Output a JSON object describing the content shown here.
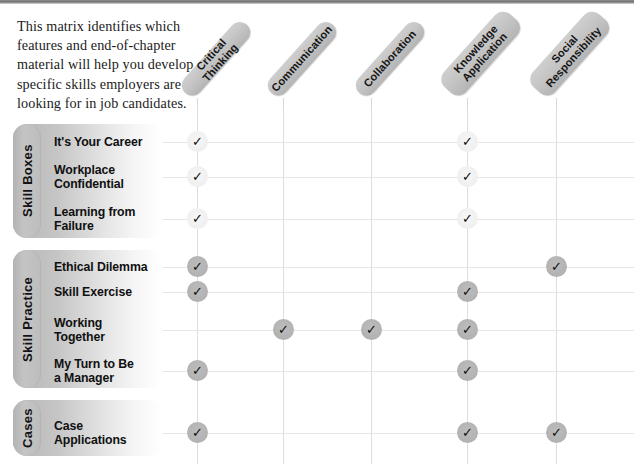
{
  "intro": {
    "text": "This matrix identifies which features and end-of-chapter material will help you develop specific skills employers are looking for in job candidates."
  },
  "columns": [
    {
      "label": "Critical Thinking",
      "lines": 1
    },
    {
      "label": "Communication",
      "lines": 1
    },
    {
      "label": "Collaboration",
      "lines": 1
    },
    {
      "label": "Knowledge\nApplication",
      "lines": 2
    },
    {
      "label": "Social\nResponsibility",
      "lines": 2
    }
  ],
  "groups": [
    {
      "label": "Skill Boxes",
      "mark_style": "light",
      "rows": [
        {
          "label": "It's Your Career",
          "marks": [
            true,
            false,
            false,
            true,
            false
          ]
        },
        {
          "label": "Workplace\nConfidential",
          "marks": [
            true,
            false,
            false,
            true,
            false
          ]
        },
        {
          "label": "Learning from\nFailure",
          "marks": [
            true,
            false,
            false,
            true,
            false
          ]
        }
      ]
    },
    {
      "label": "Skill Practice",
      "mark_style": "dark",
      "rows": [
        {
          "label": "Ethical Dilemma",
          "marks": [
            true,
            false,
            false,
            false,
            true
          ]
        },
        {
          "label": "Skill Exercise",
          "marks": [
            true,
            false,
            false,
            true,
            false
          ]
        },
        {
          "label": "Working\nTogether",
          "marks": [
            false,
            true,
            true,
            true,
            false
          ]
        },
        {
          "label": "My Turn to Be\na Manager",
          "marks": [
            true,
            false,
            false,
            true,
            false
          ]
        }
      ]
    },
    {
      "label": "Cases",
      "mark_style": "dark",
      "rows": [
        {
          "label": "Case\nApplications",
          "marks": [
            true,
            false,
            false,
            true,
            true
          ]
        }
      ]
    }
  ],
  "check_glyph": "✓",
  "colors": {
    "header_pill": "#c2c2c2",
    "band": "#bdbdbd",
    "grid_line": "#dedede",
    "mark_light": "#efefef",
    "mark_dark": "#b2b2b2",
    "text": "#101010"
  }
}
